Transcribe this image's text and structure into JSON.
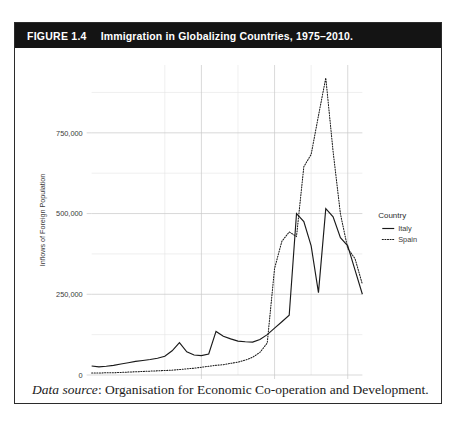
{
  "figure": {
    "number": "FIGURE 1.4",
    "title": "Immigration in Globalizing Countries, 1975–2010.",
    "source_label": "Data source",
    "source_text": ": Organisation for Economic Co-operation and Development."
  },
  "legend": {
    "title": "Country",
    "items": [
      {
        "label": "Italy",
        "style": "solid"
      },
      {
        "label": "Spain",
        "style": "dotted"
      }
    ]
  },
  "axes": {
    "y_title": "Inflows of Foreign Population",
    "y_ticks": [
      "0",
      "250,000",
      "500,000",
      "750,000"
    ],
    "x_ticks": [
      "1990",
      "2000",
      "2010"
    ]
  },
  "chart_data": {
    "type": "line",
    "title": "Immigration in Globalizing Countries, 1975–2010.",
    "xlabel": "",
    "ylabel": "Inflows of Foreign Population",
    "xlim": [
      1975,
      2012
    ],
    "ylim": [
      0,
      960000
    ],
    "y_ticks": [
      0,
      250000,
      500000,
      750000
    ],
    "y_minor_ticks": [
      125000,
      375000,
      625000,
      875000
    ],
    "x_ticks": [
      1990,
      2000,
      2010
    ],
    "x_minor_ticks": [
      1985,
      1995,
      2005
    ],
    "grid": true,
    "legend_position": "right",
    "legend_title": "Country",
    "x": [
      1975,
      1976,
      1977,
      1978,
      1979,
      1980,
      1981,
      1982,
      1983,
      1984,
      1985,
      1986,
      1987,
      1988,
      1989,
      1990,
      1991,
      1992,
      1993,
      1994,
      1995,
      1996,
      1997,
      1998,
      1999,
      2000,
      2001,
      2002,
      2003,
      2004,
      2005,
      2006,
      2007,
      2008,
      2009,
      2010,
      2011,
      2012
    ],
    "series": [
      {
        "name": "Italy",
        "style": "solid",
        "values": [
          28000,
          25000,
          27000,
          30000,
          34000,
          38000,
          42000,
          45000,
          48000,
          52000,
          58000,
          75000,
          100000,
          72000,
          62000,
          60000,
          65000,
          135000,
          120000,
          112000,
          105000,
          103000,
          102000,
          110000,
          125000,
          145000,
          165000,
          185000,
          500000,
          475000,
          400000,
          255000,
          515000,
          490000,
          425000,
          400000,
          325000,
          250000
        ]
      },
      {
        "name": "Spain",
        "style": "dotted",
        "values": [
          6000,
          6000,
          7000,
          7000,
          8000,
          9000,
          10000,
          11000,
          12000,
          13000,
          14000,
          15000,
          17000,
          19000,
          21000,
          24000,
          27000,
          30000,
          32000,
          36000,
          40000,
          46000,
          55000,
          70000,
          99000,
          330000,
          414000,
          443000,
          429000,
          645000,
          683000,
          803000,
          920000,
          692000,
          499000,
          392000,
          360000,
          281000
        ]
      }
    ]
  }
}
